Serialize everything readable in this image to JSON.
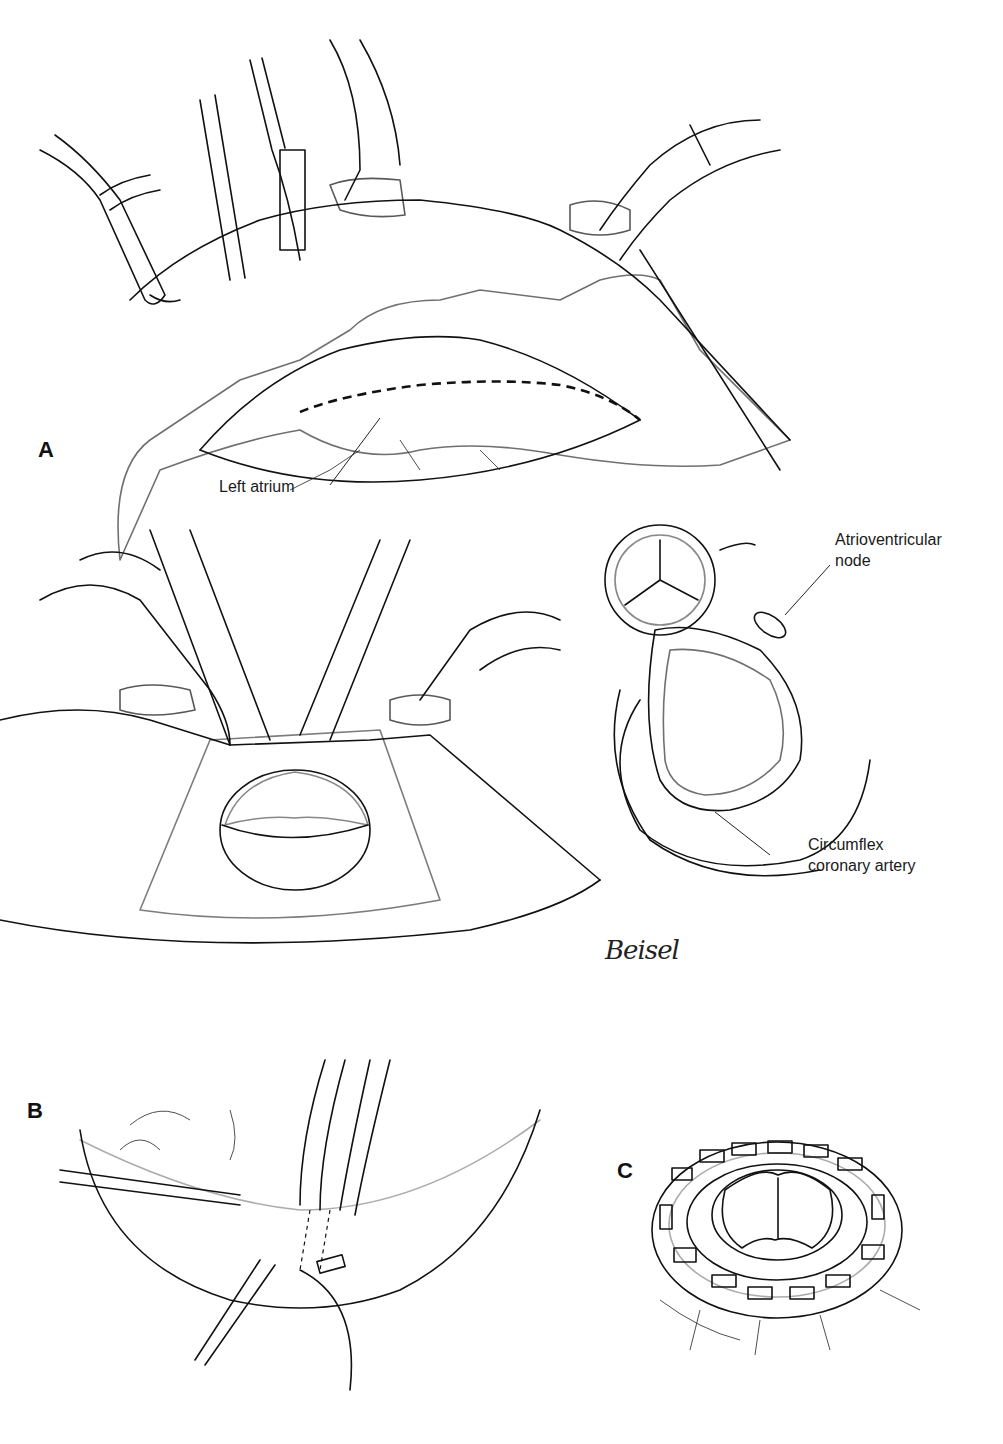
{
  "figure": {
    "panels": [
      {
        "id": "A",
        "letter": "A",
        "labels": [
          {
            "text": "Left atrium"
          }
        ]
      },
      {
        "id": "A2",
        "labels": [
          {
            "text": "Atrioventricular"
          },
          {
            "text": "node"
          },
          {
            "text": "Circumflex"
          },
          {
            "text": "coronary artery"
          }
        ]
      },
      {
        "id": "B",
        "letter": "B"
      },
      {
        "id": "C",
        "letter": "C"
      }
    ],
    "signature": "Beisel"
  }
}
